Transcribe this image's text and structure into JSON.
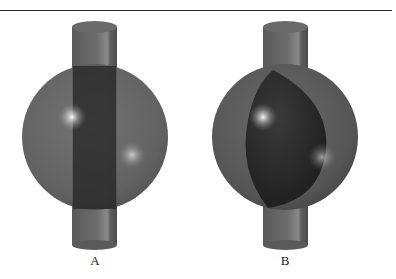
{
  "figure": {
    "panels": [
      {
        "label": "A",
        "description": "Transparent sphere with cylinder passing straight through"
      },
      {
        "label": "B",
        "description": "Sphere with lens-shaped cavity, cylinder passing through"
      }
    ],
    "colors": {
      "sphere": "#5a5a5a",
      "cylinder": "#6e6e6e",
      "core": "#2a2a2a",
      "rule": "#222222"
    }
  }
}
